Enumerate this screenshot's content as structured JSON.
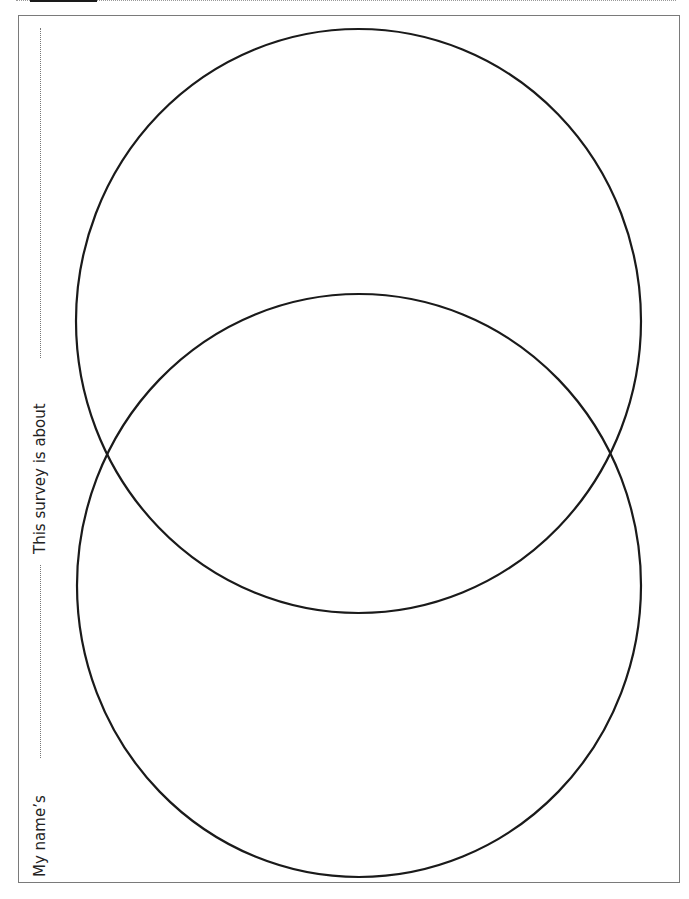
{
  "worksheet": {
    "labels": {
      "topic": "This survey is about",
      "name": "My name’s"
    },
    "venn": {
      "circles": [
        {
          "id": "top",
          "cx": 358.5,
          "cy": 321,
          "rx": 282.5,
          "ry": 292
        },
        {
          "id": "bottom",
          "cx": 359,
          "cy": 585.5,
          "rx": 282,
          "ry": 291.5
        }
      ],
      "stroke_color": "#1a1a1a"
    },
    "colors": {
      "frame": "#7a7a7a",
      "text": "#222222"
    }
  }
}
